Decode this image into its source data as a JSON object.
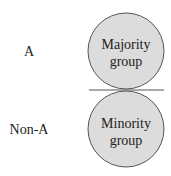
{
  "diagram": {
    "rows": [
      {
        "label": "A",
        "circle_line1": "Majority",
        "circle_line2": "group"
      },
      {
        "label": "Non-A",
        "circle_line1": "Minority",
        "circle_line2": "group"
      }
    ],
    "colors": {
      "circle_fill": "#dcdcdc",
      "circle_stroke": "#555555",
      "divider": "#555555"
    }
  }
}
